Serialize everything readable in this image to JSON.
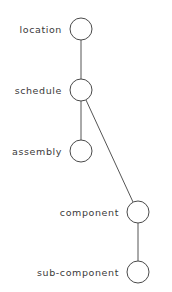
{
  "diagram": {
    "type": "hierarchy-tree",
    "nodes": [
      {
        "id": "location",
        "label": "location",
        "cx": 81,
        "cy": 29
      },
      {
        "id": "schedule",
        "label": "schedule",
        "cx": 81,
        "cy": 90
      },
      {
        "id": "assembly",
        "label": "assembly",
        "cx": 81,
        "cy": 151
      },
      {
        "id": "component",
        "label": "component",
        "cx": 138,
        "cy": 212
      },
      {
        "id": "sub-component",
        "label": "sub-component",
        "cx": 138,
        "cy": 272
      }
    ],
    "edges": [
      {
        "from": "location",
        "to": "schedule"
      },
      {
        "from": "schedule",
        "to": "assembly"
      },
      {
        "from": "schedule",
        "to": "component"
      },
      {
        "from": "component",
        "to": "sub-component"
      }
    ],
    "node_radius": 11
  }
}
